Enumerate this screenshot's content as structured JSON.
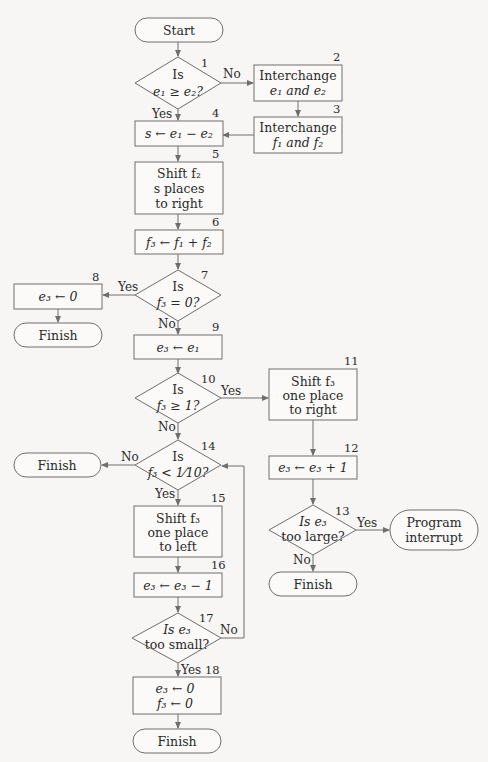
{
  "diagram": {
    "type": "flowchart",
    "colors": {
      "background": "#f7f6f4",
      "stroke": "#6e6e6e",
      "text": "#2a2a2a"
    },
    "nodes": {
      "start": {
        "shape": "terminal",
        "lines": [
          "Start"
        ]
      },
      "n1": {
        "shape": "decision",
        "number": "1",
        "lines": [
          "Is",
          "e₁ ≥ e₂?"
        ]
      },
      "n2": {
        "shape": "process",
        "number": "2",
        "lines": [
          "Interchange",
          "e₁ and e₂"
        ]
      },
      "n3": {
        "shape": "process",
        "number": "3",
        "lines": [
          "Interchange",
          "f₁ and f₂"
        ]
      },
      "n4": {
        "shape": "process",
        "number": "4",
        "lines": [
          "s ← e₁ − e₂"
        ]
      },
      "n5": {
        "shape": "process",
        "number": "5",
        "lines": [
          "Shift f₂",
          "s places",
          "to right"
        ]
      },
      "n6": {
        "shape": "process",
        "number": "6",
        "lines": [
          "f₃ ← f₁ + f₂"
        ]
      },
      "n7": {
        "shape": "decision",
        "number": "7",
        "lines": [
          "Is",
          "f₃ = 0?"
        ]
      },
      "n8": {
        "shape": "process",
        "number": "8",
        "lines": [
          "e₃ ← 0"
        ]
      },
      "finish8": {
        "shape": "terminal",
        "lines": [
          "Finish"
        ]
      },
      "n9": {
        "shape": "process",
        "number": "9",
        "lines": [
          "e₃ ← e₁"
        ]
      },
      "n10": {
        "shape": "decision",
        "number": "10",
        "lines": [
          "Is",
          "f₃ ≥ 1?"
        ]
      },
      "n11": {
        "shape": "process",
        "number": "11",
        "lines": [
          "Shift f₃",
          "one place",
          "to right"
        ]
      },
      "n12": {
        "shape": "process",
        "number": "12",
        "lines": [
          "e₃ ← e₃ + 1"
        ]
      },
      "n13": {
        "shape": "decision",
        "number": "13",
        "lines": [
          "Is e₃",
          "too large?"
        ]
      },
      "interrupt": {
        "shape": "terminal",
        "lines": [
          "Program",
          "interrupt"
        ]
      },
      "finish13": {
        "shape": "terminal",
        "lines": [
          "Finish"
        ]
      },
      "n14": {
        "shape": "decision",
        "number": "14",
        "lines": [
          "Is",
          "f₃ < 1⁄10?"
        ]
      },
      "finish14": {
        "shape": "terminal",
        "lines": [
          "Finish"
        ]
      },
      "n15": {
        "shape": "process",
        "number": "15",
        "lines": [
          "Shift f₃",
          "one place",
          "to left"
        ]
      },
      "n16": {
        "shape": "process",
        "number": "16",
        "lines": [
          "e₃ ← e₃ − 1"
        ]
      },
      "n17": {
        "shape": "decision",
        "number": "17",
        "lines": [
          "Is e₃",
          "too small?"
        ]
      },
      "n18": {
        "shape": "process",
        "number": "18",
        "lines": [
          "e₃ ← 0",
          "f₃ ← 0"
        ]
      },
      "finish18": {
        "shape": "terminal",
        "lines": [
          "Finish"
        ]
      }
    },
    "edge_labels": {
      "n1_no": "No",
      "n1_yes": "Yes",
      "n7_yes": "Yes",
      "n7_no": "No",
      "n10_yes": "Yes",
      "n10_no": "No",
      "n13_yes": "Yes",
      "n13_no": "No",
      "n14_no": "No",
      "n14_yes": "Yes",
      "n17_no": "No",
      "n17_yes": "Yes"
    },
    "edges": [
      [
        "start",
        "n1"
      ],
      [
        "n1",
        "n2",
        "No"
      ],
      [
        "n1",
        "n4",
        "Yes"
      ],
      [
        "n2",
        "n3"
      ],
      [
        "n3",
        "n4"
      ],
      [
        "n4",
        "n5"
      ],
      [
        "n5",
        "n6"
      ],
      [
        "n6",
        "n7"
      ],
      [
        "n7",
        "n8",
        "Yes"
      ],
      [
        "n8",
        "finish8"
      ],
      [
        "n7",
        "n9",
        "No"
      ],
      [
        "n9",
        "n10"
      ],
      [
        "n10",
        "n11",
        "Yes"
      ],
      [
        "n11",
        "n12"
      ],
      [
        "n12",
        "n13"
      ],
      [
        "n13",
        "interrupt",
        "Yes"
      ],
      [
        "n13",
        "finish13",
        "No"
      ],
      [
        "n10",
        "n14",
        "No"
      ],
      [
        "n14",
        "finish14",
        "No"
      ],
      [
        "n14",
        "n15",
        "Yes"
      ],
      [
        "n15",
        "n16"
      ],
      [
        "n16",
        "n17"
      ],
      [
        "n17",
        "n14",
        "No"
      ],
      [
        "n17",
        "n18",
        "Yes"
      ],
      [
        "n18",
        "finish18"
      ]
    ]
  }
}
